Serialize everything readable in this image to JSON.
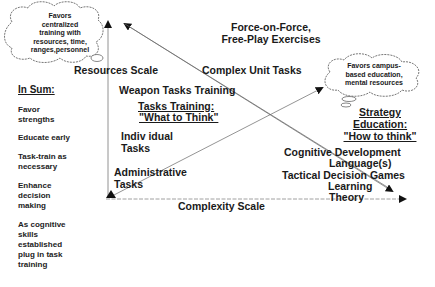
{
  "clouds": {
    "left": {
      "lines": [
        "Favors",
        "centralized",
        "training with",
        "resources, time,",
        "ranges,personnel"
      ]
    },
    "right": {
      "lines": [
        "Favors campus-",
        "based education,",
        "mental resources"
      ]
    }
  },
  "axes": {
    "y_label": "Resources Scale",
    "x_label": "Complexity Scale"
  },
  "top_label": {
    "line1": "Force-on-Force,",
    "line2": "Free-Play Exercises"
  },
  "tasks": {
    "complex_unit": "Complex Unit Tasks",
    "weapon": "Weapon Tasks Training",
    "training_title": "Tasks Training:",
    "training_subtitle": "\"What to Think\"",
    "individual_1": "Indiv idual",
    "individual_2": "Tasks",
    "admin_1": "Administrative",
    "admin_2": "Tasks"
  },
  "education": {
    "title_1": "Strategy",
    "title_2": "Education:",
    "subtitle": "\"How to think\"",
    "cognitive": "Cognitive Development",
    "language": "Language(s)",
    "tactical": "Tactical Decision Games",
    "learning_1": "Learning",
    "learning_2": "Theory"
  },
  "summary": {
    "title": "In Sum:",
    "items": [
      {
        "lines": [
          "Favor",
          "strengths"
        ]
      },
      {
        "lines": [
          "Educate early"
        ]
      },
      {
        "lines": [
          "Task-train as",
          "necessary"
        ]
      },
      {
        "lines": [
          "Enhance",
          "decision",
          "making"
        ]
      },
      {
        "lines": [
          "As cognitive",
          "skills",
          "established",
          "plug in task",
          "training"
        ]
      }
    ]
  }
}
